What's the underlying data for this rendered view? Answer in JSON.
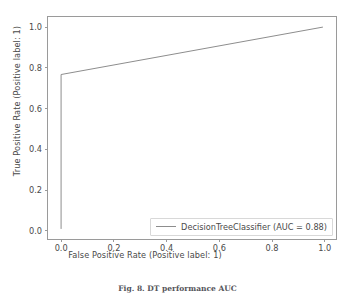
{
  "figure": {
    "caption": "Fig. 8.  DT performance AUC",
    "background_color": "#ffffff",
    "frame_color": "#9a9a9a",
    "text_color": "#4a4a4a"
  },
  "chart_data": {
    "type": "line",
    "title": "",
    "subtitle": "",
    "xlabel": "False Positive Rate (Positive label: 1)",
    "ylabel": "True Positive Rate (Positive label: 1)",
    "xlim": [
      -0.05,
      1.05
    ],
    "ylim": [
      -0.05,
      1.05
    ],
    "xticks": [
      0.0,
      0.2,
      0.4,
      0.6,
      0.8,
      1.0
    ],
    "yticks": [
      0.0,
      0.2,
      0.4,
      0.6,
      0.8,
      1.0
    ],
    "xticklabels": [
      "0.0",
      "0.2",
      "0.4",
      "0.6",
      "0.8",
      "1.0"
    ],
    "yticklabels": [
      "0.0",
      "0.2",
      "0.4",
      "0.6",
      "0.8",
      "1.0"
    ],
    "grid": false,
    "legend_position": "lower right",
    "series": [
      {
        "name": "DecisionTreeClassifier (AUC = 0.88)",
        "classifier": "DecisionTreeClassifier",
        "auc": 0.88,
        "color": "#8d8d8d",
        "linewidth": 1,
        "x": [
          0.0,
          0.0,
          1.0
        ],
        "y": [
          0.0,
          0.765,
          1.0
        ]
      }
    ],
    "annotations": []
  },
  "legend": {
    "entries": [
      {
        "label": "DecisionTreeClassifier (AUC = 0.88)",
        "color": "#8d8d8d"
      }
    ]
  }
}
